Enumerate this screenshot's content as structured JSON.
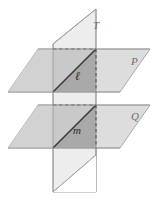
{
  "figure": {
    "background_color": "#ffffff",
    "labels": {
      "plane_t": "T",
      "plane_p": "P",
      "plane_q": "Q",
      "line_l": "ℓ",
      "line_m": "m"
    },
    "colors": {
      "plane_light": "#e8e8e8",
      "plane_mid": "#c9c9c9",
      "plane_dark": "#a9a9a9",
      "transversal_fill": "#ededed",
      "outline": "#9a9a9a",
      "intersection_line": "#3a3a3a",
      "hidden_line": "#4a4a4a",
      "label_gray": "#6e6e6e",
      "label_dark": "#2b2b2b"
    },
    "geometry": {
      "plane_t": {
        "type": "parallelogram",
        "points": "96,9 96,192 53,192 53,44"
      },
      "plane_p": {
        "type": "parallelogram",
        "points": "8,92 38,49 150,49 120,92"
      },
      "plane_q": {
        "type": "parallelogram",
        "points": "8,148 38,105 150,105 120,148"
      },
      "overlap_p": {
        "type": "parallelogram",
        "points": "53,92 53,49 96,49 96,92"
      },
      "overlap_q": {
        "type": "parallelogram",
        "points": "53,148 53,105 96,105 96,148"
      },
      "line_l": {
        "x1": 53,
        "y1": 92,
        "x2": 96,
        "y2": 49
      },
      "line_m": {
        "x1": 53,
        "y1": 148,
        "x2": 96,
        "y2": 105
      },
      "hidden_l": {
        "x1": 53,
        "y1": 49,
        "x2": 96,
        "y2": 49
      },
      "hidden_m": {
        "x1": 53,
        "y1": 105,
        "x2": 96,
        "y2": 105
      },
      "hidden_vertical_p": {
        "x1": 96,
        "y1": 49,
        "x2": 96,
        "y2": 92
      },
      "hidden_vertical_q": {
        "x1": 96,
        "y1": 105,
        "x2": 96,
        "y2": 148
      }
    }
  }
}
